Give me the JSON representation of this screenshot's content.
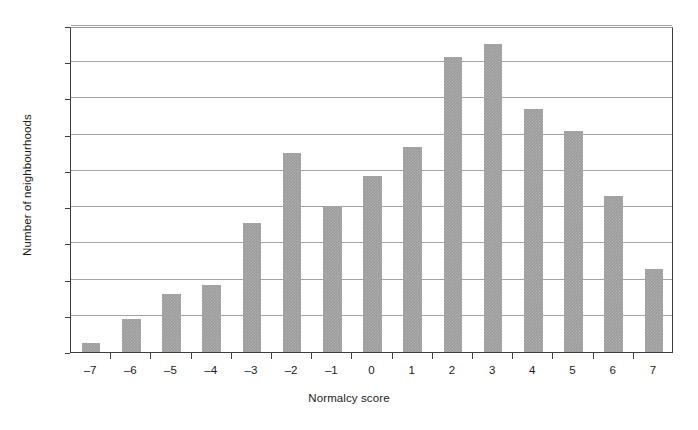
{
  "chart_data": {
    "type": "bar",
    "title": "",
    "subtitle": "",
    "xlabel": "Normalcy score",
    "ylabel": "Number of neighbourhoods",
    "categories": [
      "–7",
      "–6",
      "–5",
      "–4",
      "–3",
      "–2",
      "–1",
      "0",
      "1",
      "2",
      "3",
      "4",
      "5",
      "6",
      "7"
    ],
    "values": [
      5,
      18,
      32,
      37,
      71,
      110,
      80,
      97,
      113,
      163,
      170,
      134,
      122,
      86,
      46
    ],
    "ylim": [
      0,
      180
    ],
    "ytick_values": [
      0,
      20,
      40,
      60,
      80,
      100,
      120,
      140,
      160,
      180
    ],
    "ytick_labels": [
      "0",
      "20",
      "40",
      "60",
      "80",
      "100",
      "120",
      "140",
      "160",
      "180"
    ],
    "grid": "horizontal",
    "legend": "none",
    "bar_color": "#9c9c9c",
    "axis_color": "#3d3d3d",
    "gridline_color": "#a3a3a3",
    "background_color": "#ffffff"
  }
}
